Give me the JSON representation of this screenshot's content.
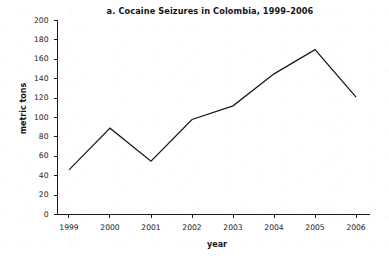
{
  "chart_data": {
    "type": "line",
    "title": "a. Cocaine Seizures in Colombia, 1999–2006",
    "xlabel": "year",
    "ylabel": "metric tons",
    "categories": [
      "1999",
      "2000",
      "2001",
      "2002",
      "2003",
      "2004",
      "2005",
      "2006"
    ],
    "values": [
      46,
      89,
      55,
      98,
      112,
      145,
      170,
      121
    ],
    "series": [
      {
        "name": "Cocaine seizures",
        "values": [
          46,
          89,
          55,
          98,
          112,
          145,
          170,
          121
        ]
      }
    ],
    "ylim": [
      0,
      200
    ],
    "ytick_step": 20,
    "yticks": [
      0,
      20,
      40,
      60,
      80,
      100,
      120,
      140,
      160,
      180,
      200
    ],
    "ytick_labels": [
      "0",
      "20",
      "40",
      "60",
      "80",
      "100",
      "120",
      "140",
      "160",
      "180",
      "200"
    ],
    "xticks": [
      "1999",
      "2000",
      "2001",
      "2002",
      "2003",
      "2004",
      "2005",
      "2006"
    ],
    "grid": false,
    "legend": false,
    "legend_position": "none",
    "line_color": "#1a1a1a",
    "axis_color": "#1a1a1a",
    "background_color": "#ffffff",
    "markers": false,
    "annotations": []
  }
}
